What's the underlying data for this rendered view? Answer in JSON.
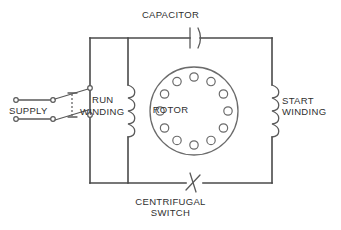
{
  "diagram": {
    "labels": {
      "capacitor": "CAPACITOR",
      "rotor": "ROTOR",
      "centrifugal_switch": "CENTRIFUGAL\nSWITCH",
      "start_winding": "START\nWINDING",
      "run": "RUN",
      "winding": "WINDING",
      "supply": "SUPPLY"
    },
    "colors": {
      "background": "#ffffff",
      "wire": "#4a4a4a",
      "symbol": "#5a5a5a",
      "rotor_outline": "#6b6b6b",
      "text": "#2f2f2f"
    },
    "components": [
      {
        "id": "capacitor",
        "type": "capacitor",
        "label": "CAPACITOR",
        "position": "top-branch"
      },
      {
        "id": "centrifugal-switch",
        "type": "switch",
        "label": "CENTRIFUGAL SWITCH",
        "position": "bottom-branch"
      },
      {
        "id": "run-winding",
        "type": "coil",
        "label": "RUN WINDING",
        "turns": 4,
        "position": "left-branch"
      },
      {
        "id": "start-winding",
        "type": "coil",
        "label": "START WINDING",
        "turns": 4,
        "position": "right-branch"
      },
      {
        "id": "rotor",
        "type": "rotor",
        "label": "ROTOR",
        "bars": 12,
        "position": "center"
      },
      {
        "id": "supply",
        "type": "source",
        "label": "SUPPLY",
        "terminals": 4,
        "position": "left"
      },
      {
        "id": "supply-switch",
        "type": "double-pole-switch",
        "poles": 2,
        "position": "left"
      }
    ],
    "rotor": {
      "bar_count": 12,
      "bar_radius": 4.2,
      "ring_radius": 34,
      "center_x": 194,
      "center_y": 111
    },
    "coils": {
      "turns": 4
    }
  }
}
